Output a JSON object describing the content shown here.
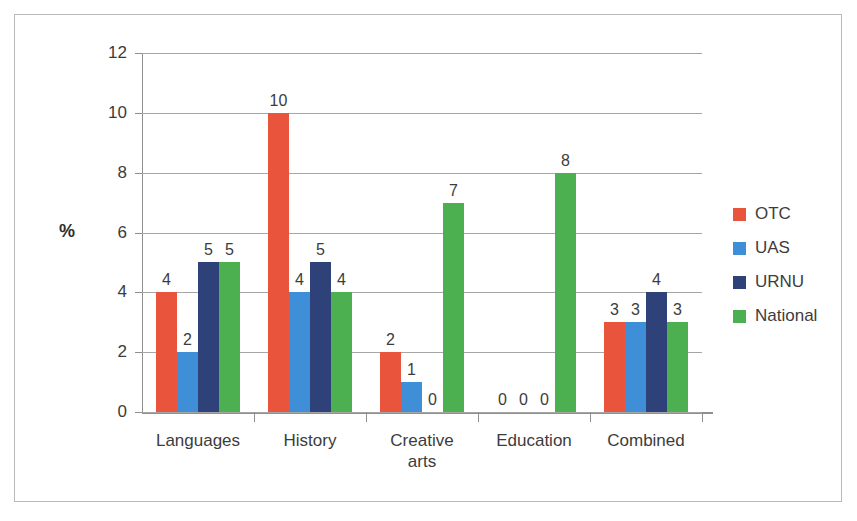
{
  "chart_data": {
    "type": "bar",
    "title": "",
    "subtitle": "",
    "xlabel": "",
    "ylabel": "%",
    "ylim": [
      0,
      12
    ],
    "ytick_values": [
      0,
      2,
      4,
      6,
      8,
      10,
      12
    ],
    "ytick_labels": [
      "0",
      "2",
      "4",
      "6",
      "8",
      "10",
      "12"
    ],
    "grid": true,
    "legend_position": "right",
    "categories": [
      "Languages",
      "History",
      "Creative\narts",
      "Education",
      "Combined"
    ],
    "series": [
      {
        "name": "OTC",
        "color": "#E8553C",
        "values": [
          4,
          10,
          2,
          0,
          3
        ]
      },
      {
        "name": "UAS",
        "color": "#3E8FD8",
        "values": [
          2,
          4,
          1,
          0,
          3
        ]
      },
      {
        "name": "URNU",
        "color": "#2E4178",
        "values": [
          5,
          5,
          0,
          0,
          4
        ]
      },
      {
        "name": "National",
        "color": "#4CAF50",
        "values": [
          5,
          4,
          7,
          8,
          3
        ]
      }
    ],
    "data_labels": [
      [
        "4",
        "10",
        "2",
        "0",
        "3"
      ],
      [
        "2",
        "4",
        "1",
        "0",
        "3"
      ],
      [
        "5",
        "5",
        "0",
        "0",
        "4"
      ],
      [
        "5",
        "4",
        "7",
        "8",
        "3"
      ]
    ]
  },
  "legend": {
    "items": [
      {
        "label": "OTC",
        "color": "#E8553C"
      },
      {
        "label": "UAS",
        "color": "#3E8FD8"
      },
      {
        "label": "URNU",
        "color": "#2E4178"
      },
      {
        "label": "National",
        "color": "#4CAF50"
      }
    ]
  },
  "frame": {
    "border_color": "#b9b9b9",
    "background": "#ffffff"
  }
}
